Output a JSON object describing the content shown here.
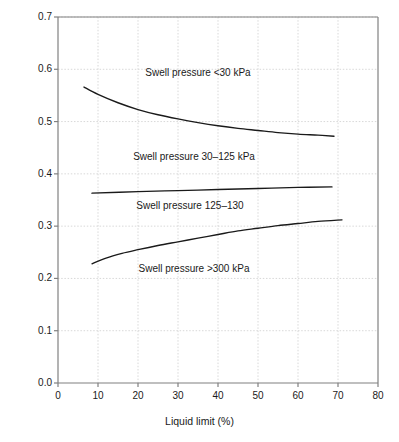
{
  "chart_data": {
    "type": "line",
    "title": "",
    "xlabel": "Liquid limit (%)",
    "ylabel": "Swell index Is",
    "ylabel_symbol": "I",
    "ylabel_subscript": "s",
    "ylabel_prefix": "Swell index ",
    "xlim": [
      0,
      80
    ],
    "ylim": [
      0.0,
      0.7
    ],
    "xticks": [
      "0",
      "10",
      "20",
      "30",
      "40",
      "50",
      "60",
      "70",
      "80"
    ],
    "xtick_values": [
      0,
      10,
      20,
      30,
      40,
      50,
      60,
      70,
      80
    ],
    "yticks": [
      "0.0",
      "0.1",
      "0.2",
      "0.3",
      "0.4",
      "0.5",
      "0.6",
      "0.7"
    ],
    "ytick_values": [
      0.0,
      0.1,
      0.2,
      0.3,
      0.4,
      0.5,
      0.6,
      0.7
    ],
    "grid": true,
    "grid_style": "dotted",
    "grid_color": "#d8d8d8",
    "line_color": "#1a1a1a",
    "axis_color": "#808080",
    "legend": "none",
    "annotations": [
      {
        "text": "Swell pressure <30 kPa",
        "x": 35,
        "y": 0.593
      },
      {
        "text": "Swell pressure 30–125 kPa",
        "x": 34,
        "y": 0.432
      },
      {
        "text": "Swell pressure 125–130",
        "x": 33,
        "y": 0.338
      },
      {
        "text": "Swell pressure >300 kPa",
        "x": 34,
        "y": 0.218
      }
    ],
    "series": [
      {
        "name": "Boundary: swell pressure <30 kPa / 30-125 kPa",
        "points": [
          [
            6.5,
            0.566
          ],
          [
            10,
            0.552
          ],
          [
            15,
            0.536
          ],
          [
            20,
            0.523
          ],
          [
            25,
            0.513
          ],
          [
            30,
            0.505
          ],
          [
            35,
            0.498
          ],
          [
            40,
            0.492
          ],
          [
            45,
            0.487
          ],
          [
            50,
            0.483
          ],
          [
            55,
            0.479
          ],
          [
            60,
            0.476
          ],
          [
            65,
            0.474
          ],
          [
            69,
            0.472
          ]
        ]
      },
      {
        "name": "Boundary: swell pressure 30-125 kPa / 125-130",
        "points": [
          [
            8.5,
            0.363
          ],
          [
            20,
            0.366
          ],
          [
            30,
            0.368
          ],
          [
            40,
            0.37
          ],
          [
            50,
            0.372
          ],
          [
            60,
            0.374
          ],
          [
            68.5,
            0.375
          ]
        ]
      },
      {
        "name": "Boundary: swell pressure 125-130 / >300 kPa",
        "points": [
          [
            8.5,
            0.228
          ],
          [
            12,
            0.239
          ],
          [
            16,
            0.248
          ],
          [
            20,
            0.255
          ],
          [
            25,
            0.263
          ],
          [
            30,
            0.27
          ],
          [
            35,
            0.277
          ],
          [
            40,
            0.284
          ],
          [
            45,
            0.291
          ],
          [
            50,
            0.296
          ],
          [
            55,
            0.301
          ],
          [
            60,
            0.305
          ],
          [
            65,
            0.309
          ],
          [
            71,
            0.312
          ]
        ]
      }
    ]
  }
}
